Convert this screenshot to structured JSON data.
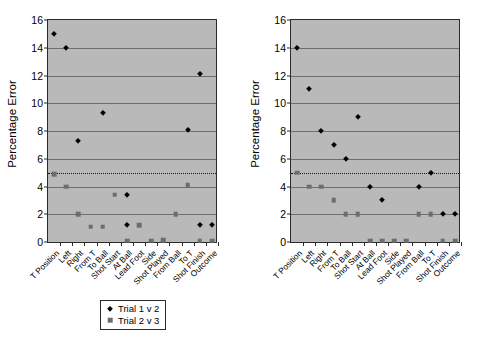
{
  "chart_data": [
    {
      "type": "scatter",
      "panel": "left",
      "title": "",
      "xlabel": "",
      "ylabel": "Percentage Error",
      "ylim": [
        0,
        16
      ],
      "yticks": [
        0,
        2,
        4,
        6,
        8,
        10,
        12,
        14,
        16
      ],
      "grid": true,
      "legend_position": "bottom",
      "reference_line": 5,
      "categories": [
        "T Position",
        "Left",
        "Right",
        "From T",
        "To Ball",
        "Shot Start",
        "At Ball",
        "Lead Foot",
        "Side",
        "Shot Played",
        "From Ball",
        "To T",
        "Shot Finish",
        "Outcome"
      ],
      "series": [
        {
          "name": "Trial 1 v 2",
          "marker": "diamond",
          "color": "#000000",
          "values": [
            15.0,
            14.0,
            7.3,
            null,
            9.3,
            null,
            3.4,
            null,
            null,
            null,
            null,
            8.1,
            12.1,
            null
          ]
        },
        {
          "name": "Trial 2 v 3",
          "marker": "square",
          "color": "#6d6d6d",
          "values": [
            4.9,
            4.0,
            2.0,
            1.1,
            1.1,
            3.4,
            0.1,
            1.2,
            0.1,
            0.15,
            2.0,
            4.1,
            0.1,
            0.1
          ]
        }
      ],
      "extra_points": [
        {
          "series": "Trial 1 v 2",
          "category": "At Ball",
          "value": 1.2
        },
        {
          "series": "Trial 1 v 2",
          "category": "Shot Finish",
          "value": 1.2
        },
        {
          "series": "Trial 1 v 2",
          "category": "Outcome",
          "value": 1.2
        }
      ]
    },
    {
      "type": "scatter",
      "panel": "right",
      "title": "",
      "xlabel": "",
      "ylabel": "Percentage Error",
      "ylim": [
        0,
        16
      ],
      "yticks": [
        0,
        2,
        4,
        6,
        8,
        10,
        12,
        14,
        16
      ],
      "grid": true,
      "legend_position": "bottom",
      "reference_line": 5,
      "categories": [
        "T Position",
        "Left",
        "Right",
        "From T",
        "To Ball",
        "Shot Start",
        "At Ball",
        "Lead Foot",
        "Side",
        "Shot Played",
        "From Ball",
        "To T",
        "Shot Finish",
        "Outcome"
      ],
      "series": [
        {
          "name": "Trial 1 v 2",
          "marker": "diamond",
          "color": "#000000",
          "values": [
            14.0,
            11.0,
            8.0,
            7.0,
            6.0,
            9.0,
            4.0,
            3.0,
            null,
            null,
            4.0,
            5.0,
            2.0,
            2.0
          ]
        },
        {
          "name": "Trial 2 v 3",
          "marker": "square",
          "color": "#6d6d6d",
          "values": [
            5.0,
            4.0,
            4.0,
            3.0,
            2.0,
            2.0,
            0.1,
            0.1,
            0.1,
            0.1,
            2.0,
            2.0,
            0.1,
            0.1
          ]
        }
      ],
      "extra_points": []
    }
  ],
  "panels": [
    {
      "id": "left",
      "ylabel": "Percentage Error",
      "yticks": [
        "16",
        "14",
        "12",
        "10",
        "8",
        "6",
        "4",
        "2",
        "0"
      ],
      "xlabels": [
        "T Position",
        "Left",
        "Right",
        "From T",
        "To Ball",
        "Shot Start",
        "At Ball",
        "Lead Foot",
        "Side",
        "Shot Played",
        "From Ball",
        "To T",
        "Shot Finish",
        "Outcome"
      ],
      "legend": [
        {
          "label": "Trial 1 v 2",
          "marker": "diamond"
        },
        {
          "label": "Trial 2 v 3",
          "marker": "square"
        }
      ],
      "points": [
        {
          "series": 0,
          "xi": 0,
          "y": 15.0
        },
        {
          "series": 0,
          "xi": 1,
          "y": 14.0
        },
        {
          "series": 0,
          "xi": 2,
          "y": 7.3
        },
        {
          "series": 0,
          "xi": 4,
          "y": 9.3
        },
        {
          "series": 0,
          "xi": 6,
          "y": 3.4
        },
        {
          "series": 0,
          "xi": 6,
          "y": 1.2
        },
        {
          "series": 0,
          "xi": 11,
          "y": 8.1
        },
        {
          "series": 0,
          "xi": 12,
          "y": 12.1
        },
        {
          "series": 0,
          "xi": 12,
          "y": 1.2
        },
        {
          "series": 0,
          "xi": 13,
          "y": 1.2
        },
        {
          "series": 1,
          "xi": 0,
          "y": 4.9
        },
        {
          "series": 1,
          "xi": 1,
          "y": 4.0
        },
        {
          "series": 1,
          "xi": 2,
          "y": 2.0
        },
        {
          "series": 1,
          "xi": 3,
          "y": 1.1
        },
        {
          "series": 1,
          "xi": 4,
          "y": 1.1
        },
        {
          "series": 1,
          "xi": 5,
          "y": 3.4
        },
        {
          "series": 1,
          "xi": 6,
          "y": 0.1
        },
        {
          "series": 1,
          "xi": 7,
          "y": 1.2
        },
        {
          "series": 1,
          "xi": 8,
          "y": 0.1
        },
        {
          "series": 1,
          "xi": 9,
          "y": 0.15
        },
        {
          "series": 1,
          "xi": 10,
          "y": 2.0
        },
        {
          "series": 1,
          "xi": 11,
          "y": 4.1
        },
        {
          "series": 1,
          "xi": 12,
          "y": 0.1
        },
        {
          "series": 1,
          "xi": 13,
          "y": 0.1
        }
      ]
    },
    {
      "id": "right",
      "ylabel": "Percentage Error",
      "yticks": [
        "16",
        "14",
        "12",
        "10",
        "8",
        "6",
        "4",
        "2",
        "0"
      ],
      "xlabels": [
        "T Position",
        "Left",
        "Right",
        "From T",
        "To Ball",
        "Shot Start",
        "At Ball",
        "Lead Foot",
        "Side",
        "Shot Played",
        "From Ball",
        "To T",
        "Shot Finish",
        "Outcome"
      ],
      "legend": [
        {
          "label": "Trial 1 v 2",
          "marker": "diamond"
        },
        {
          "label": "Trial 2 v 3",
          "marker": "square"
        }
      ],
      "points": [
        {
          "series": 0,
          "xi": 0,
          "y": 14.0
        },
        {
          "series": 0,
          "xi": 1,
          "y": 11.0
        },
        {
          "series": 0,
          "xi": 2,
          "y": 8.0
        },
        {
          "series": 0,
          "xi": 3,
          "y": 7.0
        },
        {
          "series": 0,
          "xi": 4,
          "y": 6.0
        },
        {
          "series": 0,
          "xi": 5,
          "y": 9.0
        },
        {
          "series": 0,
          "xi": 6,
          "y": 4.0
        },
        {
          "series": 0,
          "xi": 7,
          "y": 3.0
        },
        {
          "series": 0,
          "xi": 10,
          "y": 4.0
        },
        {
          "series": 0,
          "xi": 11,
          "y": 5.0
        },
        {
          "series": 0,
          "xi": 12,
          "y": 2.0
        },
        {
          "series": 0,
          "xi": 13,
          "y": 2.0
        },
        {
          "series": 1,
          "xi": 0,
          "y": 5.0
        },
        {
          "series": 1,
          "xi": 1,
          "y": 4.0
        },
        {
          "series": 1,
          "xi": 2,
          "y": 4.0
        },
        {
          "series": 1,
          "xi": 3,
          "y": 3.0
        },
        {
          "series": 1,
          "xi": 4,
          "y": 2.0
        },
        {
          "series": 1,
          "xi": 5,
          "y": 2.0
        },
        {
          "series": 1,
          "xi": 6,
          "y": 0.1
        },
        {
          "series": 1,
          "xi": 7,
          "y": 0.1
        },
        {
          "series": 1,
          "xi": 8,
          "y": 0.1
        },
        {
          "series": 1,
          "xi": 9,
          "y": 0.1
        },
        {
          "series": 1,
          "xi": 10,
          "y": 2.0
        },
        {
          "series": 1,
          "xi": 11,
          "y": 2.0
        },
        {
          "series": 1,
          "xi": 12,
          "y": 0.1
        },
        {
          "series": 1,
          "xi": 13,
          "y": 0.1
        }
      ]
    }
  ],
  "colors": {
    "plot_background": "#b9b9b9",
    "gridline": "#6f6f6f",
    "series_1": "#000000",
    "series_2": "#6d6d6d",
    "axis": "#2b2b2b"
  }
}
